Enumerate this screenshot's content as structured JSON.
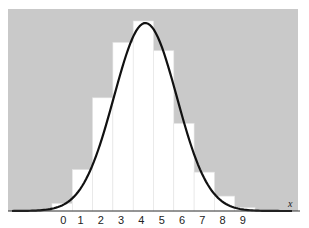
{
  "chart_data": {
    "type": "bar",
    "title": "",
    "xlabel": "x",
    "ylabel": "",
    "categories": [
      "0",
      "1",
      "2",
      "3",
      "4",
      "5",
      "6",
      "7",
      "8",
      "9"
    ],
    "series": [
      {
        "name": "histogram (probability)",
        "values": [
          0.009,
          0.05,
          0.137,
          0.204,
          0.23,
          0.194,
          0.106,
          0.047,
          0.018,
          0.004
        ]
      }
    ],
    "overlay": {
      "type": "line",
      "name": "normal approximation curve",
      "description": "bell-shaped curve peaking near x = 4"
    },
    "grid": false,
    "legend": "none",
    "background_color": "#c9c9c9",
    "bar_color": "#ffffff",
    "curve_color": "#111111"
  },
  "axis": {
    "variable_label": "x",
    "tick_labels": [
      "0",
      "1",
      "2",
      "3",
      "4",
      "5",
      "6",
      "7",
      "8",
      "9"
    ]
  }
}
